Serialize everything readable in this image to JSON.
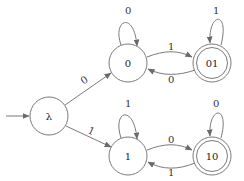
{
  "diagram": {
    "type": "finite-automaton",
    "colors": {
      "stroke": "#7a7a7a",
      "text": "#222222",
      "background": "#ffffff"
    },
    "start_state": "λ",
    "states": [
      {
        "id": "lambda",
        "label": "λ",
        "x": 49,
        "y": 116,
        "accepting": false,
        "self_loop_label": null
      },
      {
        "id": "s0",
        "label": "0",
        "x": 128,
        "y": 63,
        "accepting": false,
        "self_loop_label": "0"
      },
      {
        "id": "s01",
        "label": "01",
        "x": 212,
        "y": 63,
        "accepting": true,
        "self_loop_label": "1"
      },
      {
        "id": "s1",
        "label": "1",
        "x": 128,
        "y": 156,
        "accepting": false,
        "self_loop_label": "1"
      },
      {
        "id": "s10",
        "label": "10",
        "x": 212,
        "y": 156,
        "accepting": true,
        "self_loop_label": "0"
      }
    ],
    "transitions": [
      {
        "from": "λ",
        "to": "0",
        "label": "0"
      },
      {
        "from": "λ",
        "to": "1",
        "label": "1"
      },
      {
        "from": "0",
        "to": "0",
        "label": "0"
      },
      {
        "from": "0",
        "to": "01",
        "label": "1"
      },
      {
        "from": "01",
        "to": "0",
        "label": "0"
      },
      {
        "from": "01",
        "to": "01",
        "label": "1"
      },
      {
        "from": "1",
        "to": "1",
        "label": "1"
      },
      {
        "from": "1",
        "to": "10",
        "label": "0"
      },
      {
        "from": "10",
        "to": "1",
        "label": "1"
      },
      {
        "from": "10",
        "to": "10",
        "label": "0"
      }
    ],
    "labels": {
      "lambda_to_0": "0",
      "lambda_to_1": "1",
      "loop_0": "0",
      "loop_01": "1",
      "loop_1": "1",
      "loop_10": "0",
      "e_0_01": "1",
      "e_01_0": "0",
      "e_1_10": "0",
      "e_10_1": "1"
    }
  }
}
